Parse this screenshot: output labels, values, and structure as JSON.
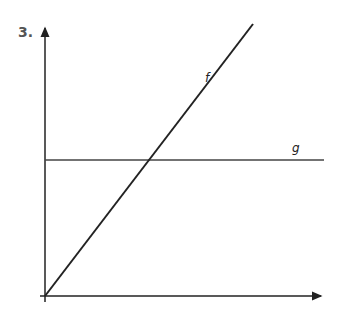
{
  "problem": {
    "number": "3."
  },
  "graph": {
    "axes": {
      "origin": [
        45,
        296
      ],
      "x_end": [
        323,
        296
      ],
      "y_end": [
        45,
        26
      ]
    },
    "lines": [
      {
        "name": "f",
        "label": "f",
        "from": [
          45,
          296
        ],
        "to": [
          253,
          24
        ],
        "label_pos": [
          207,
          79
        ]
      },
      {
        "name": "g",
        "label": "g",
        "from": [
          45,
          160
        ],
        "to": [
          324,
          160
        ],
        "label_pos": [
          292,
          152
        ]
      }
    ],
    "colors": {
      "axis": "#222222",
      "line_f": "#222222",
      "line_g": "#444444"
    }
  }
}
